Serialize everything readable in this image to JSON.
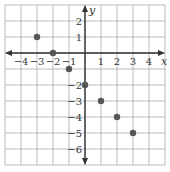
{
  "chart_data": {
    "type": "scatter",
    "title": "",
    "xlabel": "x",
    "ylabel": "y",
    "xlim": [
      -5,
      5
    ],
    "ylim": [
      -7,
      3
    ],
    "grid": true,
    "x_ticks": [
      -4,
      -3,
      -2,
      -1,
      1,
      2,
      3,
      4
    ],
    "x_tick_labels": [
      "−4",
      "−3",
      "−2",
      "−1",
      "1",
      "2",
      "3",
      "4"
    ],
    "y_ticks": [
      2,
      1,
      -2,
      -3,
      -4,
      -5,
      -6
    ],
    "y_tick_labels": [
      "2",
      "1",
      "−2",
      "−3",
      "−4",
      "−5",
      "−6"
    ],
    "series": [
      {
        "name": "points",
        "x": [
          -3,
          -2,
          -1,
          0,
          1,
          2,
          3
        ],
        "y": [
          1,
          0,
          -1,
          -2,
          -3,
          -4,
          -5
        ]
      }
    ],
    "colors": {
      "grid": "#aaaaaa",
      "axis": "#333333",
      "point": "#555555"
    }
  }
}
